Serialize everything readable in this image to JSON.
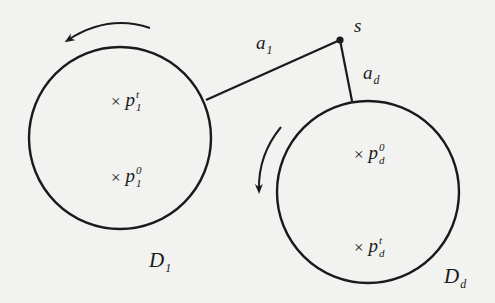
{
  "diagram": {
    "type": "two disks connected to a common point s",
    "colors": {
      "ink": "#1a1a1a",
      "background": "#f2f2f0"
    },
    "source_point": {
      "label": "s",
      "x": 340,
      "y": 40
    },
    "edges": [
      {
        "label_base": "a",
        "label_sub": "1",
        "from": "s",
        "to": "D1"
      },
      {
        "label_base": "a",
        "label_sub": "d",
        "from": "s",
        "to": "Dd"
      }
    ],
    "disks": [
      {
        "label_base": "D",
        "label_sub": "1",
        "rotation": "counterclockwise",
        "points": [
          {
            "marker": "×",
            "base": "p",
            "sup": "t",
            "sub": "1"
          },
          {
            "marker": "×",
            "base": "p",
            "sup": "0",
            "sub": "1"
          }
        ]
      },
      {
        "label_base": "D",
        "label_sub": "d",
        "rotation": "counterclockwise",
        "points": [
          {
            "marker": "×",
            "base": "p",
            "sup": "0",
            "sub": "d"
          },
          {
            "marker": "×",
            "base": "p",
            "sup": "t",
            "sub": "d"
          }
        ]
      }
    ]
  }
}
